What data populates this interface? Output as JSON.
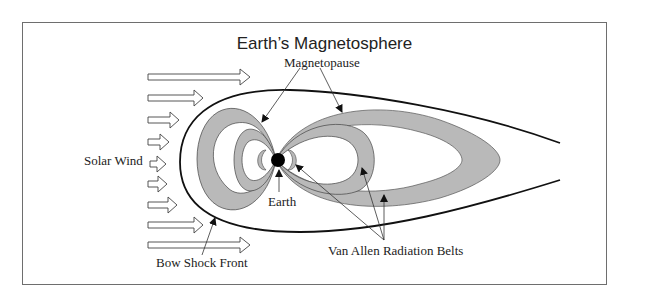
{
  "title": "Earth’s Magnetosphere",
  "labels": {
    "magnetopause": "Magnetopause",
    "solar_wind": "Solar Wind",
    "earth": "Earth",
    "bow_shock": "Bow Shock Front",
    "van_allen": "Van Allen Radiation Belts"
  },
  "colors": {
    "belt_fill": "#b9b9b9",
    "line": "#1a1a1a",
    "frame": "#6e6e6e",
    "earth": "#000000"
  }
}
